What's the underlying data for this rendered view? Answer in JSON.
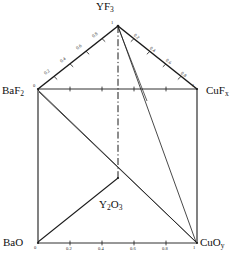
{
  "diagram": {
    "type": "prism-phase-diagram",
    "title_vertex_top": "YF3",
    "corner_labels": {
      "top": "YF",
      "top_sub": "3",
      "left_upper": "BaF",
      "left_upper_sub": "2",
      "right_upper": "CuF",
      "right_upper_sub": "x",
      "left_lower": "BaO",
      "right_lower": "CuO",
      "right_lower_sub": "y",
      "center": "Y",
      "center_sub1": "2",
      "center_o": "O",
      "center_sub2": "3"
    },
    "center_label_full": "Y2O3",
    "axes": {
      "left_edge": {
        "name": "baf2-yf3-edge",
        "from_value": "0",
        "to_value": "1",
        "ticks": [
          "0.2",
          "0.4",
          "0.6",
          "0.8"
        ]
      },
      "right_edge": {
        "name": "yf3-cufx-edge",
        "from_value": "1",
        "to_value": "1",
        "ticks": [
          "0.2",
          "0.4",
          "0.6",
          "0.8"
        ]
      },
      "top_horizontal": {
        "name": "baf2-cufx-edge",
        "left_value": "0",
        "right_value": "1",
        "ticks": [
          "0.2",
          "0.4",
          "0.6",
          "0.8"
        ]
      },
      "bottom_horizontal": {
        "name": "bao-cuoy-edge",
        "left_value": "0",
        "right_value": "1",
        "ticks": [
          "0.2",
          "0.4",
          "0.6",
          "0.8"
        ]
      }
    },
    "colors": {
      "line": "#1a1a1a",
      "background": "#ffffff",
      "text": "#111111"
    }
  }
}
